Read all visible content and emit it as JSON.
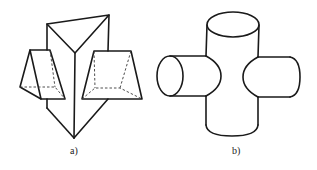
{
  "figures": [
    {
      "id": "a",
      "label": "a)",
      "description": "triangular prism with two wedge-shaped (trapezoidal) prisms intersecting its side faces",
      "label_pos": [
        74,
        146
      ]
    },
    {
      "id": "b",
      "label": "b)",
      "description": "vertical cylinder intersected by two horizontal cylinders on left and right",
      "label_pos": [
        236,
        146
      ]
    }
  ],
  "style": {
    "line_color": "#1a1a1a",
    "background": "#ffffff"
  }
}
